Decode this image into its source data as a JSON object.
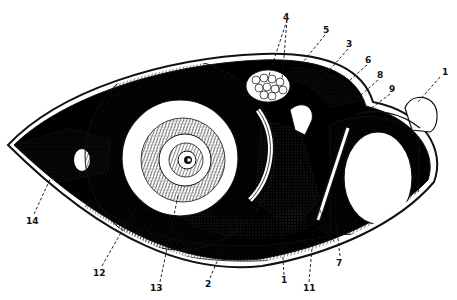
{
  "figure": {
    "type": "anatomical cross-section illustration",
    "colors": {
      "ink": "#111111",
      "paper": "#ffffff",
      "fill_dark": "#000000"
    },
    "labels": [
      {
        "id": "l4",
        "text": "4",
        "x": 287,
        "y": 18,
        "tx": 270,
        "ty": 70
      },
      {
        "id": "l5",
        "text": "5",
        "x": 326,
        "y": 32,
        "tx": 290,
        "ty": 78
      },
      {
        "id": "l3",
        "text": "3",
        "x": 349,
        "y": 46,
        "tx": 305,
        "ty": 90
      },
      {
        "id": "l6",
        "text": "6",
        "x": 368,
        "y": 62,
        "tx": 322,
        "ty": 102
      },
      {
        "id": "l8",
        "text": "8",
        "x": 379,
        "y": 77,
        "tx": 335,
        "ty": 116
      },
      {
        "id": "l9",
        "text": "9",
        "x": 392,
        "y": 91,
        "tx": 347,
        "ty": 126
      },
      {
        "id": "l1top",
        "text": "1",
        "x": 443,
        "y": 74,
        "tx": 420,
        "ty": 100
      },
      {
        "id": "l14",
        "text": "14",
        "x": 28,
        "y": 222,
        "tx": 60,
        "ty": 165
      },
      {
        "id": "l12",
        "text": "12",
        "x": 96,
        "y": 275,
        "tx": 135,
        "ty": 208
      },
      {
        "id": "l13",
        "text": "13",
        "x": 152,
        "y": 290,
        "tx": 180,
        "ty": 198
      },
      {
        "id": "l2",
        "text": "2",
        "x": 206,
        "y": 286,
        "tx": 238,
        "ty": 213
      },
      {
        "id": "l1bot",
        "text": "1",
        "x": 283,
        "y": 282,
        "tx": 280,
        "ty": 205
      },
      {
        "id": "l11",
        "text": "11",
        "x": 306,
        "y": 290,
        "tx": 315,
        "ty": 215
      },
      {
        "id": "l7",
        "text": "7",
        "x": 338,
        "y": 265,
        "tx": 335,
        "ty": 220
      }
    ]
  }
}
